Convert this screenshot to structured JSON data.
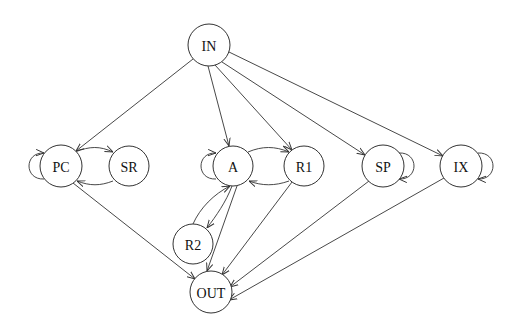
{
  "diagram": {
    "type": "state-graph",
    "nodes": [
      {
        "id": "IN",
        "label": "IN",
        "x": 209,
        "y": 45,
        "r": 21
      },
      {
        "id": "PC",
        "label": "PC",
        "x": 61,
        "y": 166,
        "r": 21
      },
      {
        "id": "SR",
        "label": "SR",
        "x": 129,
        "y": 166,
        "r": 20
      },
      {
        "id": "A",
        "label": "A",
        "x": 233,
        "y": 166,
        "r": 20
      },
      {
        "id": "R1",
        "label": "R1",
        "x": 304,
        "y": 166,
        "r": 20
      },
      {
        "id": "SP",
        "label": "SP",
        "x": 383,
        "y": 166,
        "r": 21
      },
      {
        "id": "IX",
        "label": "IX",
        "x": 461,
        "y": 166,
        "r": 21
      },
      {
        "id": "R2",
        "label": "R2",
        "x": 193,
        "y": 244,
        "r": 20
      },
      {
        "id": "OUT",
        "label": "OUT",
        "x": 211,
        "y": 292,
        "r": 21
      }
    ],
    "edges": [
      {
        "from": "IN",
        "to": "PC"
      },
      {
        "from": "IN",
        "to": "A"
      },
      {
        "from": "IN",
        "to": "R1"
      },
      {
        "from": "IN",
        "to": "SP"
      },
      {
        "from": "IN",
        "to": "IX"
      },
      {
        "from": "PC",
        "to": "PC",
        "self_loop": true
      },
      {
        "from": "PC",
        "to": "SR"
      },
      {
        "from": "SR",
        "to": "PC"
      },
      {
        "from": "A",
        "to": "A",
        "self_loop": true
      },
      {
        "from": "A",
        "to": "R1"
      },
      {
        "from": "R1",
        "to": "A"
      },
      {
        "from": "R2",
        "to": "A"
      },
      {
        "from": "A",
        "to": "R2"
      },
      {
        "from": "SP",
        "to": "SP",
        "self_loop": true
      },
      {
        "from": "IX",
        "to": "IX",
        "self_loop": true
      },
      {
        "from": "PC",
        "to": "OUT"
      },
      {
        "from": "A",
        "to": "OUT"
      },
      {
        "from": "R1",
        "to": "OUT"
      },
      {
        "from": "SP",
        "to": "OUT"
      },
      {
        "from": "IX",
        "to": "OUT"
      }
    ]
  }
}
